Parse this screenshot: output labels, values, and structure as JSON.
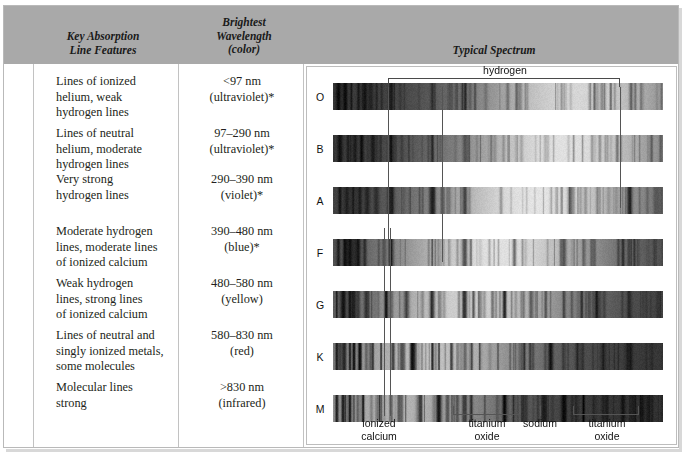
{
  "headers": {
    "key_features": "Key Absorption\nLine Features",
    "brightest": "Brightest\nWavelength\n(color)",
    "typical_spectrum": "Typical Spectrum"
  },
  "colors": {
    "header_band": "#a9a9a9",
    "rule": "#c2c2c2",
    "frame": "#b9b9b9",
    "ink": "#231f20"
  },
  "rows": [
    {
      "class": "O",
      "features": "Lines of ionized\nhelium, weak\nhydrogen lines",
      "wavelength": "<97 nm\n(ultraviolet)*"
    },
    {
      "class": "B",
      "features": "Lines of neutral\nhelium, moderate\nhydrogen lines",
      "wavelength": "97–290 nm\n(ultraviolet)*"
    },
    {
      "class": "A",
      "features": "Very strong\nhydrogen lines",
      "wavelength": "290–390 nm\n(violet)*"
    },
    {
      "class": "F",
      "features": "Moderate hydrogen\nlines, moderate lines\nof ionized calcium",
      "wavelength": "390–480 nm\n(blue)*"
    },
    {
      "class": "G",
      "features": "Weak hydrogen\nlines, strong lines\nof ionized calcium",
      "wavelength": "480–580 nm\n(yellow)"
    },
    {
      "class": "K",
      "features": "Lines of neutral and\nsingly ionized metals,\nsome molecules",
      "wavelength": "580–830 nm\n(red)"
    },
    {
      "class": "M",
      "features": "Molecular lines\nstrong",
      "wavelength": ">830 nm\n(infrared)"
    }
  ],
  "annotations": {
    "hydrogen": "hydrogen",
    "ionized_calcium": "ionized\ncalcium",
    "titanium_oxide_left": "titanium\noxide",
    "sodium": "sodium",
    "titanium_oxide_right": "titanium\noxide"
  },
  "chart_data": {
    "type": "heatmap",
    "title": "Typical Spectrum",
    "xlabel": "wavelength (increasing to the right)",
    "ylabel": "spectral class",
    "categories": [
      "O",
      "B",
      "A",
      "F",
      "G",
      "K",
      "M"
    ],
    "grid": false,
    "legend": "none",
    "note": "Each row is a grayscale stellar absorption spectrum; dark vertical features are absorption lines. Continuum brightness peak shifts to longer wavelength for cooler classes.",
    "series": [
      {
        "name": "O",
        "continuum_peak_frac": 0.74,
        "overall_darkness": 0.52,
        "lines_frac": [
          0.015,
          0.035,
          0.055,
          0.075,
          0.095,
          0.115,
          0.175,
          0.3,
          0.4
        ]
      },
      {
        "name": "B",
        "continuum_peak_frac": 0.7,
        "overall_darkness": 0.46,
        "lines_frac": [
          0.02,
          0.045,
          0.065,
          0.085,
          0.12,
          0.175,
          0.3,
          0.4,
          0.73
        ]
      },
      {
        "name": "A",
        "continuum_peak_frac": 0.62,
        "overall_darkness": 0.44,
        "lines_frac": [
          0.02,
          0.04,
          0.06,
          0.08,
          0.1,
          0.13,
          0.175,
          0.3,
          0.4,
          0.72,
          0.9
        ]
      },
      {
        "name": "F",
        "continuum_peak_frac": 0.5,
        "overall_darkness": 0.46,
        "lines_frac": [
          0.015,
          0.035,
          0.05,
          0.062,
          0.075,
          0.095,
          0.175,
          0.3,
          0.4,
          0.55,
          0.7,
          0.88
        ]
      },
      {
        "name": "G",
        "continuum_peak_frac": 0.42,
        "overall_darkness": 0.55,
        "lines_frac": [
          0.01,
          0.03,
          0.05,
          0.062,
          0.075,
          0.1,
          0.16,
          0.22,
          0.3,
          0.4,
          0.52,
          0.6,
          0.7,
          0.8,
          0.9
        ]
      },
      {
        "name": "K",
        "continuum_peak_frac": 0.3,
        "overall_darkness": 0.64,
        "lines_frac": [
          0.01,
          0.03,
          0.05,
          0.062,
          0.08,
          0.12,
          0.18,
          0.24,
          0.3,
          0.36,
          0.42,
          0.5,
          0.58,
          0.66,
          0.74,
          0.82,
          0.9
        ]
      },
      {
        "name": "M",
        "continuum_peak_frac": 0.2,
        "overall_darkness": 0.72,
        "lines_frac": [
          0.01,
          0.03,
          0.05,
          0.062,
          0.09,
          0.14,
          0.2,
          0.26,
          0.32,
          0.4,
          0.46,
          0.52,
          0.58,
          0.64,
          0.7,
          0.76,
          0.82,
          0.88,
          0.94
        ]
      }
    ],
    "markers": {
      "hydrogen_span_frac": [
        0.167,
        0.87
      ],
      "hydrogen_tick_frac": 0.33,
      "ionized_calcium_frac": [
        0.152,
        0.175
      ],
      "titanium_oxide_left_frac": [
        0.393,
        0.94
      ],
      "sodium_frac": 0.627,
      "titanium_oxide_right_frac": [
        0.7,
        0.945
      ]
    }
  }
}
